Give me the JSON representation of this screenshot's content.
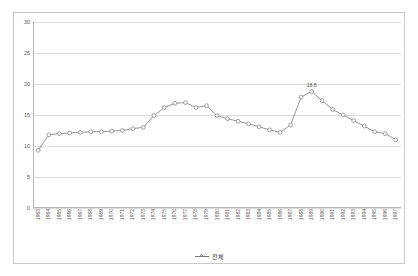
{
  "chart_data": {
    "type": "line",
    "title": "",
    "xlabel": "",
    "ylabel": "",
    "ylim": [
      0,
      30
    ],
    "yticks": [
      0,
      5,
      10,
      15,
      20,
      25,
      30
    ],
    "grid": true,
    "legend_position": "bottom",
    "marker": "circle-open",
    "line_color": "#7a7a7a",
    "grid_color": "#dcdcdc",
    "axis_color": "#b5b5b5",
    "categories": [
      "1963",
      "1964",
      "1965",
      "1966",
      "1967",
      "1968",
      "1969",
      "1970",
      "1971",
      "1972",
      "1973",
      "1974",
      "1975",
      "1976",
      "1977",
      "1978",
      "1979",
      "1980",
      "1981",
      "1982",
      "1983",
      "1984",
      "1985",
      "1986",
      "1987",
      "1988",
      "1989",
      "1990",
      "1991",
      "1992",
      "1993",
      "1994",
      "1995",
      "1996",
      "1997"
    ],
    "series": [
      {
        "name": "전체",
        "values": [
          9.3,
          11.8,
          12.0,
          12.1,
          12.2,
          12.3,
          12.3,
          12.4,
          12.5,
          12.8,
          13.0,
          14.9,
          16.2,
          16.9,
          17.0,
          16.2,
          16.5,
          14.9,
          14.4,
          14.0,
          13.6,
          13.1,
          12.6,
          12.2,
          13.4,
          17.9,
          18.8,
          17.3,
          15.9,
          15.0,
          14.1,
          13.2,
          12.3,
          12.0,
          11.0
        ]
      }
    ],
    "annotations": [
      {
        "label": "18.8",
        "x": "1989",
        "y": 18.8
      }
    ]
  },
  "legend": {
    "entries": [
      {
        "label": "전체",
        "marker": "circle-open"
      }
    ]
  }
}
